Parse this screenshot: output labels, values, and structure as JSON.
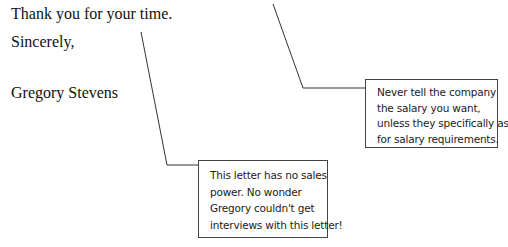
{
  "letter": {
    "closing_line": "Thank you for your time.",
    "signoff": "Sincerely,",
    "signature": "Gregory Stevens"
  },
  "callouts": {
    "salary_note": {
      "lines": [
        "Never tell the company",
        "the salary you want,",
        "unless they specifically ask",
        "for salary requirements."
      ]
    },
    "sales_power_note": {
      "lines": [
        "This letter has no sales",
        "power. No wonder",
        "Gregory couldn't get",
        "interviews with this letter!"
      ]
    }
  }
}
